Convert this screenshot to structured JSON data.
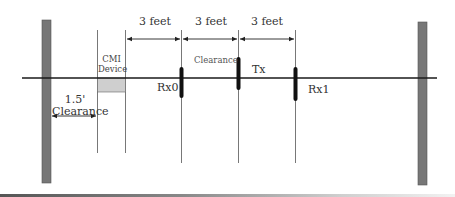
{
  "diagram": {
    "type": "antenna-test-setup-layout",
    "colors": {
      "wall": "#777777",
      "line": "#1a1a1a",
      "device_fill": "#cfcfcf",
      "antenna": "#111111",
      "guide_line": "#555555"
    },
    "walls": [
      {
        "id": "left-wall",
        "label": ""
      },
      {
        "id": "right-wall",
        "label": ""
      }
    ],
    "dimensions": [
      {
        "id": "dim-1",
        "label": "3 feet"
      },
      {
        "id": "dim-2",
        "label": "3 feet"
      },
      {
        "id": "dim-3",
        "label": "3 feet"
      }
    ],
    "device": {
      "label_line1": "CMI",
      "label_line2": "Device"
    },
    "clearance_small": {
      "label": "Clearance"
    },
    "clearance_wall": {
      "value": "1.5'",
      "label": "Clearance"
    },
    "antennas": [
      {
        "id": "rx0",
        "label": "Rx0"
      },
      {
        "id": "tx",
        "label": "Tx"
      },
      {
        "id": "rx1",
        "label": "Rx1"
      }
    ]
  }
}
